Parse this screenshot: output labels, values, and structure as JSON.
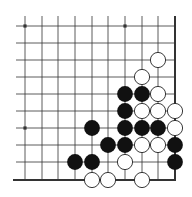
{
  "diagram": {
    "type": "go-board-corner",
    "grid": {
      "columns": 10,
      "rows": 10,
      "col_x": [
        25,
        42,
        58,
        75,
        92,
        108,
        125,
        142,
        158,
        175
      ],
      "row_y": [
        26,
        43,
        60,
        77,
        94,
        111,
        128,
        145,
        162,
        180
      ],
      "line_start_x": 16,
      "line_start_y": 16,
      "edges": [
        "right",
        "bottom"
      ]
    },
    "star_points": [
      {
        "col": 0,
        "row": 0
      },
      {
        "col": 6,
        "row": 0
      },
      {
        "col": 0,
        "row": 6
      }
    ],
    "stones": {
      "black": [
        {
          "col": 6,
          "row": 4
        },
        {
          "col": 7,
          "row": 4
        },
        {
          "col": 6,
          "row": 5
        },
        {
          "col": 4,
          "row": 6
        },
        {
          "col": 6,
          "row": 6
        },
        {
          "col": 7,
          "row": 6
        },
        {
          "col": 8,
          "row": 6
        },
        {
          "col": 5,
          "row": 7
        },
        {
          "col": 6,
          "row": 7
        },
        {
          "col": 9,
          "row": 7
        },
        {
          "col": 3,
          "row": 8
        },
        {
          "col": 4,
          "row": 8
        },
        {
          "col": 9,
          "row": 8
        }
      ],
      "white": [
        {
          "col": 8,
          "row": 2
        },
        {
          "col": 7,
          "row": 3
        },
        {
          "col": 8,
          "row": 4
        },
        {
          "col": 7,
          "row": 5
        },
        {
          "col": 8,
          "row": 5
        },
        {
          "col": 9,
          "row": 5
        },
        {
          "col": 9,
          "row": 6
        },
        {
          "col": 7,
          "row": 7
        },
        {
          "col": 8,
          "row": 7
        },
        {
          "col": 6,
          "row": 8
        },
        {
          "col": 4,
          "row": 9
        },
        {
          "col": 5,
          "row": 9
        },
        {
          "col": 7,
          "row": 9
        }
      ]
    },
    "colors": {
      "line": "#333333",
      "black_stone": "#111111",
      "white_stone_fill": "#ffffff",
      "white_stone_stroke": "#222222"
    }
  }
}
